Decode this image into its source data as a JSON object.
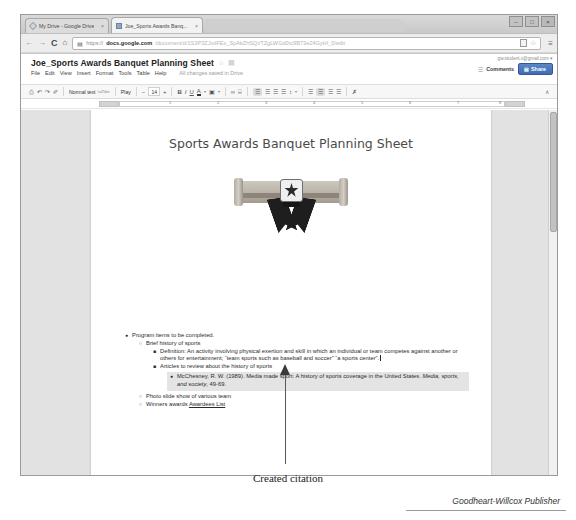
{
  "browser": {
    "tabs": [
      {
        "label": "My Drive - Google Drive",
        "close": "×",
        "favicon": "drive-favicon"
      },
      {
        "label": "Joe_Sports Awards Banq...",
        "close": "×",
        "favicon": "docs-favicon"
      }
    ],
    "window_buttons": {
      "minimize": "–",
      "maximize": "□",
      "close": "×"
    },
    "nav": {
      "back": "←",
      "forward": "→",
      "reload": "C",
      "home": "⌂"
    },
    "omnibox": {
      "lock": "▤",
      "scheme": "https://",
      "host": "docs.google.com",
      "path": "/document/d/1S3P3ZJvdFEx_SpAkZhSQzTZgLWGd0tc9B73e24GyHI_0/edit",
      "bookmark_star": "☆",
      "menu": "≡"
    }
  },
  "docs": {
    "title": "Joe_Sports Awards Banquet Planning Sheet",
    "title_star": "☆",
    "title_folder": "▤",
    "menus": [
      "File",
      "Edit",
      "View",
      "Insert",
      "Format",
      "Tools",
      "Table",
      "Help"
    ],
    "save_status": "All changes saved in Drive",
    "account_email": "gw.student.x@gmail.com ▾",
    "grid_icon": "☰",
    "comments_label": "Comments",
    "share_label": "Share",
    "share_lock": "▤",
    "toolbar": {
      "print": "⎙",
      "undo": "↶",
      "redo": "↷",
      "paint_format": "✐",
      "style": "Normal text",
      "font": "Play",
      "font_size": "14",
      "bold": "B",
      "italic": "I",
      "underline": "U",
      "text_color": "A",
      "highlight": "▣",
      "link": "∞",
      "comment": "⌸",
      "align_left": "☰",
      "align_center": "☰",
      "align_right": "☰",
      "align_justify": "☰",
      "line_spacing": "↕",
      "numbered_list": "☰",
      "bulleted_list": "☰",
      "indent_less": "☰",
      "indent_more": "☰",
      "clear_format": "✗",
      "collapse_toolbar": "∧"
    },
    "ruler": {
      "numbers": [
        "1",
        "2",
        "3",
        "4",
        "5",
        "6",
        "7",
        "8"
      ]
    }
  },
  "document": {
    "heading": "Sports Awards Banquet Planning Sheet",
    "image_alt": "diploma-scroll-with-ribbon",
    "outline": [
      {
        "level": 1,
        "bullet": "●",
        "text": "Program items to be completed."
      },
      {
        "level": 2,
        "bullet": "○",
        "text": "Brief history of sports"
      },
      {
        "level": 3,
        "bullet": "■",
        "text": "Definition: An activity involving physical exertion and skill in which an individual or team competes against another or others for entertainment; “team sports such as baseball and soccer” “a sports center”."
      },
      {
        "level": 3,
        "bullet": "■",
        "text": "Articles to review about the history of sports"
      },
      {
        "level": 4,
        "bullet": "●",
        "highlighted": true,
        "text_plain": "McChesney, R. W. (1989). Media made sport: A history of sports coverage in the United States. Media, sports, and society, 49-69.",
        "text_pre_italic": "McChesney, R. W. (1989). Media made sport: A history of sports coverage in the United States. ",
        "text_italic": "Media, sports, and society",
        "text_post_italic": ", 49-69."
      },
      {
        "level": 2,
        "bullet": "○",
        "text": "Photo slide show of various team"
      },
      {
        "level": 2,
        "bullet": "○",
        "text_prefix": "Winners awards ",
        "link_text": "Awardees List"
      }
    ]
  },
  "annotation": {
    "caption": "Created citation"
  },
  "footer": {
    "credit": "Goodheart-Willcox Publisher"
  }
}
